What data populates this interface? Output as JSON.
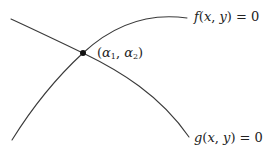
{
  "diagram": {
    "curves": [
      {
        "id": "f",
        "label": "f(x, y) = 0",
        "label_parts": {
          "fn": "f",
          "open": "(",
          "x": "x",
          "comma": ", ",
          "y": "y",
          "close": ")",
          "eq": " = 0"
        },
        "path": "M 12 140 C 40 95, 70 65, 83 53 C 110 28, 145 12, 187 18",
        "color": "#3a3a3a"
      },
      {
        "id": "g",
        "label": "g(x, y) = 0",
        "label_parts": {
          "fn": "g",
          "open": "(",
          "x": "x",
          "comma": ", ",
          "y": "y",
          "close": ")",
          "eq": " = 0"
        },
        "path": "M 11 19 C 35 30, 60 42, 83 53 C 120 71, 160 95, 189 137",
        "color": "#3a3a3a"
      }
    ],
    "intersection": {
      "x": 83,
      "y": 53,
      "label": "(α1, α2)",
      "label_parts": {
        "open": "(",
        "a": "α",
        "sub1": "1",
        "comma": ", ",
        "b": "α",
        "sub2": "2",
        "close": ")"
      }
    }
  }
}
